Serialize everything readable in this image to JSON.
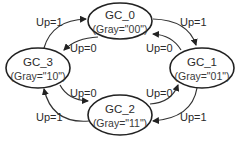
{
  "diagram": {
    "type": "state-machine",
    "title": "",
    "states": [
      {
        "id": "GC_0",
        "name": "GC_0",
        "code": "(Gray=\"00\")"
      },
      {
        "id": "GC_1",
        "name": "GC_1",
        "code": "(Gray=\"01\")"
      },
      {
        "id": "GC_2",
        "name": "GC_2",
        "code": "(Gray=\"11\")"
      },
      {
        "id": "GC_3",
        "name": "GC_3",
        "code": "(Gray=\"10\")"
      }
    ],
    "transitions": [
      {
        "from": "GC_3",
        "to": "GC_0",
        "label": "Up=1"
      },
      {
        "from": "GC_0",
        "to": "GC_3",
        "label": "Up=0"
      },
      {
        "from": "GC_0",
        "to": "GC_1",
        "label": "Up=1"
      },
      {
        "from": "GC_1",
        "to": "GC_0",
        "label": "Up=0"
      },
      {
        "from": "GC_3",
        "to": "GC_2",
        "label": "Up=0"
      },
      {
        "from": "GC_2",
        "to": "GC_3",
        "label": "Up=1"
      },
      {
        "from": "GC_2",
        "to": "GC_1",
        "label": "Up=0"
      },
      {
        "from": "GC_1",
        "to": "GC_2",
        "label": "Up=1"
      }
    ]
  }
}
